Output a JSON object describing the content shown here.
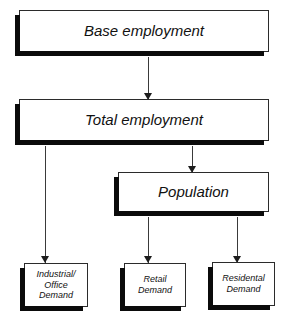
{
  "diagram": {
    "style": {
      "box_fill": "#ffffff",
      "box_border": "#2b2b2b",
      "shadow": "#0b0b0b",
      "connector": "#3a3a3a",
      "text": "#111111"
    },
    "nodes": [
      {
        "id": "base",
        "label": "Base employment",
        "level": 1
      },
      {
        "id": "total",
        "label": "Total employment",
        "level": 2
      },
      {
        "id": "population",
        "label": "Population",
        "level": 3
      },
      {
        "id": "industrial",
        "label": "Industrial/\nOffice\nDemand",
        "level": 4
      },
      {
        "id": "retail",
        "label": "Retail\nDemand",
        "level": 4
      },
      {
        "id": "residential",
        "label": "Residental\nDemand",
        "level": 4
      }
    ],
    "edges": [
      {
        "id": "base-total",
        "from": "base",
        "to": "total",
        "arrow": "down"
      },
      {
        "id": "total-industrial",
        "from": "total",
        "to": "industrial",
        "arrow": "down"
      },
      {
        "id": "total-population",
        "from": "total",
        "to": "population",
        "arrow": "down"
      },
      {
        "id": "pop-retail",
        "from": "population",
        "to": "retail",
        "arrow": "down"
      },
      {
        "id": "pop-residential",
        "from": "population",
        "to": "residential",
        "arrow": "down"
      }
    ]
  }
}
